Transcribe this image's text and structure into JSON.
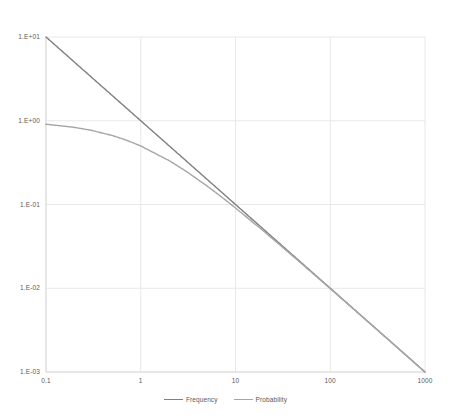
{
  "chart_data": {
    "type": "line",
    "title": "",
    "xlabel": "",
    "ylabel": "",
    "xscale": "log",
    "yscale": "log",
    "xlim": [
      0.1,
      1000
    ],
    "ylim": [
      0.001,
      10
    ],
    "grid": true,
    "legend_position": "bottom",
    "x_tick_labels": [
      "0.1",
      "1",
      "10",
      "100",
      "1000"
    ],
    "x_tick_values": [
      0.1,
      1,
      10,
      100,
      1000
    ],
    "y_tick_labels": [
      "1.E+01",
      "1.E+00",
      "1.E-01",
      "1.E-02",
      "1.E-03"
    ],
    "y_tick_values": [
      10,
      1,
      0.1,
      0.01,
      0.001
    ],
    "series": [
      {
        "name": "Frequency",
        "color": "#808080",
        "formula": "y = 1/x",
        "x": [
          0.1,
          0.2,
          0.3,
          0.5,
          0.7,
          1,
          2,
          3,
          5,
          7,
          10,
          20,
          30,
          50,
          70,
          100,
          200,
          300,
          500,
          700,
          1000
        ],
        "values": [
          10,
          5,
          3.333,
          2,
          1.4286,
          1,
          0.5,
          0.3333,
          0.2,
          0.1429,
          0.1,
          0.05,
          0.03333,
          0.02,
          0.014286,
          0.01,
          0.005,
          0.003333,
          0.002,
          0.0014286,
          0.001
        ]
      },
      {
        "name": "Probability",
        "color": "#a6a6a6",
        "formula": "y = 1/(1+x)",
        "x": [
          0.1,
          0.2,
          0.3,
          0.5,
          0.7,
          1,
          2,
          3,
          5,
          7,
          10,
          20,
          30,
          50,
          70,
          100,
          200,
          300,
          500,
          700,
          1000
        ],
        "values": [
          0.9091,
          0.8333,
          0.7692,
          0.6667,
          0.5882,
          0.5,
          0.3333,
          0.25,
          0.1667,
          0.125,
          0.0909,
          0.04762,
          0.03226,
          0.019608,
          0.014085,
          0.009901,
          0.004975,
          0.003322,
          0.001996,
          0.0014265,
          0.000999
        ]
      }
    ]
  },
  "legend": {
    "items": [
      {
        "label": "Frequency",
        "color": "#808080"
      },
      {
        "label": "Probability",
        "color": "#a6a6a6"
      }
    ]
  },
  "colors": {
    "grid": "#e8e8e8",
    "axis": "#d9d9d9",
    "text": "#595959",
    "background": "#ffffff",
    "frequency": "#808080",
    "probability": "#a6a6a6"
  }
}
